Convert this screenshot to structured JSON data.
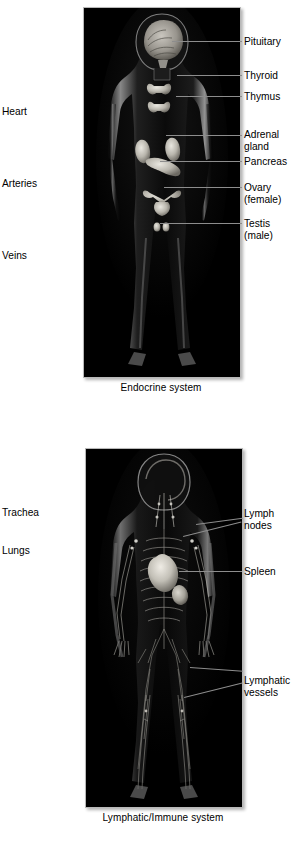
{
  "page": {
    "background": "#ffffff",
    "text_color": "#000000",
    "leader_color": "#8d8d8d",
    "panel_background": "#000000",
    "panel_border": "#b8b8b8"
  },
  "figures": [
    {
      "id": "endocrine",
      "caption": "Endocrine system",
      "panel": {
        "x": 83,
        "y": 7,
        "w": 156,
        "h": 369
      },
      "labels_left": [
        {
          "name": "heart",
          "text": "Heart",
          "x": 2,
          "y": 106
        },
        {
          "name": "arteries",
          "text": "Arteries",
          "x": 2,
          "y": 178
        },
        {
          "name": "veins",
          "text": "Veins",
          "x": 2,
          "y": 250
        }
      ],
      "labels_right": [
        {
          "name": "pituitary",
          "text": "Pituitary",
          "x": 244,
          "y": 36,
          "leader_y": 41,
          "leader_x1": 172,
          "leader_x2": 242
        },
        {
          "name": "thyroid",
          "text": "Thyroid",
          "x": 244,
          "y": 70,
          "leader_y": 75,
          "leader_x1": 177,
          "leader_x2": 242
        },
        {
          "name": "thymus",
          "text": "Thymus",
          "x": 244,
          "y": 91,
          "leader_y": 96,
          "leader_x1": 176,
          "leader_x2": 242
        },
        {
          "name": "adrenal-gland",
          "text": "Adrenal\ngland",
          "x": 244,
          "y": 129,
          "leader_y": 135,
          "leader_x1": 166,
          "leader_x2": 242
        },
        {
          "name": "pancreas",
          "text": "Pancreas",
          "x": 244,
          "y": 156,
          "leader_y": 161,
          "leader_x1": 160,
          "leader_x2": 242
        },
        {
          "name": "ovary-female",
          "text": "Ovary\n(female)",
          "x": 244,
          "y": 182,
          "leader_y": 187,
          "leader_x1": 164,
          "leader_x2": 242
        },
        {
          "name": "testis-male",
          "text": "Testis\n(male)",
          "x": 244,
          "y": 218,
          "leader_y": 223,
          "leader_x1": 160,
          "leader_x2": 242
        }
      ]
    },
    {
      "id": "lymphatic",
      "caption": "Lymphatic/Immune system",
      "panel": {
        "x": 85,
        "y": 448,
        "w": 156,
        "h": 358
      },
      "labels_left": [
        {
          "name": "trachea",
          "text": "Trachea",
          "x": 2,
          "y": 507
        },
        {
          "name": "lungs",
          "text": "Lungs",
          "x": 2,
          "y": 545
        }
      ],
      "labels_right": [
        {
          "name": "lymph-nodes",
          "text": "Lymph\nnodes",
          "x": 244,
          "y": 508,
          "leader_y": 514,
          "leader_x1": 196,
          "leader_x2": 242
        },
        {
          "name": "spleen",
          "text": "Spleen",
          "x": 244,
          "y": 566,
          "leader_y": 571,
          "leader_x1": 179,
          "leader_x2": 242
        },
        {
          "name": "lymphatic-vessels",
          "text": "Lymphatic\nvessels",
          "x": 244,
          "y": 675,
          "leader_y": 680,
          "leader_x1": 190,
          "leader_x2": 242
        }
      ]
    }
  ]
}
